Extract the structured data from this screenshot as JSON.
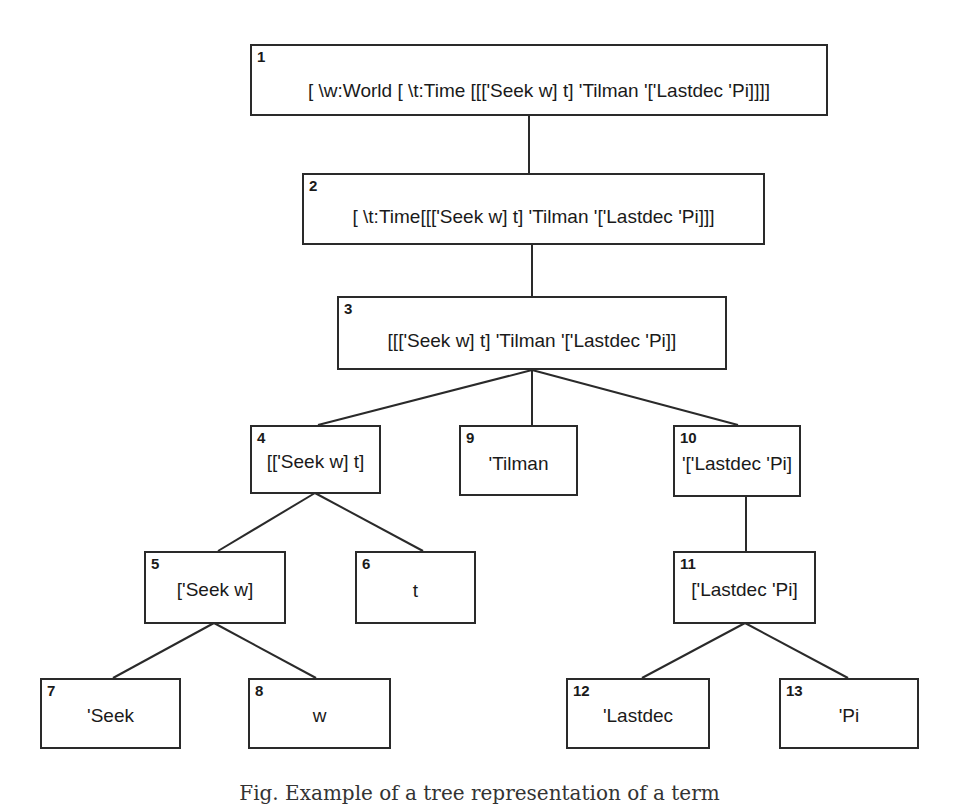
{
  "diagram": {
    "type": "tree",
    "nodes": [
      {
        "id": "1",
        "label": "[ \\w:World [ \\t:Time [[['Seek w] t] 'Tilman '['Lastdec 'Pi]]]]"
      },
      {
        "id": "2",
        "label": "[ \\t:Time[[['Seek w] t] 'Tilman '['Lastdec 'Pi]]]"
      },
      {
        "id": "3",
        "label": "[[['Seek w] t] 'Tilman '['Lastdec 'Pi]]"
      },
      {
        "id": "4",
        "label": "[['Seek w] t]"
      },
      {
        "id": "5",
        "label": "['Seek w]"
      },
      {
        "id": "6",
        "label": "t"
      },
      {
        "id": "7",
        "label": "'Seek"
      },
      {
        "id": "8",
        "label": "w"
      },
      {
        "id": "9",
        "label": "'Tilman"
      },
      {
        "id": "10",
        "label": "'['Lastdec 'Pi]"
      },
      {
        "id": "11",
        "label": "['Lastdec 'Pi]"
      },
      {
        "id": "12",
        "label": "'Lastdec"
      },
      {
        "id": "13",
        "label": "'Pi"
      }
    ],
    "edges": [
      [
        "1",
        "2"
      ],
      [
        "2",
        "3"
      ],
      [
        "3",
        "4"
      ],
      [
        "3",
        "9"
      ],
      [
        "3",
        "10"
      ],
      [
        "4",
        "5"
      ],
      [
        "4",
        "6"
      ],
      [
        "5",
        "7"
      ],
      [
        "5",
        "8"
      ],
      [
        "10",
        "11"
      ],
      [
        "11",
        "12"
      ],
      [
        "11",
        "13"
      ]
    ]
  },
  "caption": "Fig. Example of a tree representation of a term"
}
